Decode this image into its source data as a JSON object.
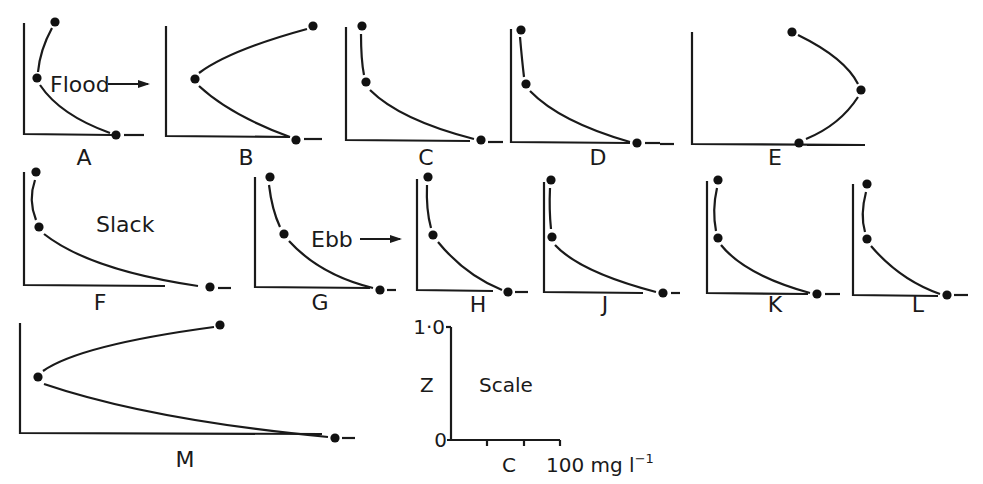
{
  "figure": {
    "ink_color": "#1a1a1a",
    "background": "#ffffff"
  },
  "annotations": {
    "flood": {
      "text": "Flood",
      "x": 50,
      "y": 92,
      "arrow": [
        108,
        84,
        148,
        84
      ]
    },
    "slack": {
      "text": "Slack",
      "x": 96,
      "y": 232
    },
    "ebb": {
      "text": "Ebb",
      "x": 311,
      "y": 247,
      "arrow": [
        360,
        239,
        400,
        239
      ]
    }
  },
  "panels": [
    {
      "id": "A",
      "label": "A",
      "axis": {
        "x0": 24,
        "ytop": 23,
        "ybot": 134,
        "xend": 112
      },
      "points": [
        [
          55,
          22
        ],
        [
          37,
          78
        ],
        [
          116,
          135
        ]
      ],
      "curves": [
        "M 52 28 Q 40 50 38 72",
        "M 40 85 Q 60 115 110 133"
      ],
      "dash": [
        124,
        135,
        144,
        135
      ],
      "labelPos": [
        84,
        165
      ]
    },
    {
      "id": "B",
      "label": "B",
      "axis": {
        "x0": 166,
        "ytop": 26,
        "ybot": 136,
        "xend": 290
      },
      "points": [
        [
          313,
          26
        ],
        [
          195,
          79
        ],
        [
          296,
          140
        ]
      ],
      "curves": [
        "M 307 29 Q 230 50 199 73",
        "M 199 86 Q 230 115 290 137"
      ],
      "dash": [
        304,
        139,
        322,
        139
      ],
      "labelPos": [
        246,
        165
      ]
    },
    {
      "id": "C",
      "label": "C",
      "axis": {
        "x0": 346,
        "ytop": 27,
        "ybot": 140,
        "xend": 470
      },
      "points": [
        [
          362,
          26
        ],
        [
          366,
          82
        ],
        [
          481,
          140
        ]
      ],
      "curves": [
        "M 361 34 Q 361 60 364 75",
        "M 370 90 Q 400 120 474 139"
      ],
      "dash": [
        488,
        142,
        503,
        142
      ],
      "labelPos": [
        426,
        165
      ]
    },
    {
      "id": "D",
      "label": "D",
      "axis": {
        "x0": 511,
        "ytop": 29,
        "ybot": 142,
        "xend": 630
      },
      "points": [
        [
          521,
          30
        ],
        [
          526,
          84
        ],
        [
          637,
          143
        ]
      ],
      "curves": [
        "M 520 37 Q 522 60 524 77",
        "M 530 91 Q 560 122 630 142"
      ],
      "dash": [
        645,
        143,
        660,
        143
      ],
      "labelPos": [
        598,
        165
      ]
    },
    {
      "id": "E",
      "label": "E",
      "axis": {
        "x0": 692,
        "ytop": 32,
        "ybot": 144,
        "xend": 865
      },
      "points": [
        [
          792,
          32
        ],
        [
          861,
          90
        ],
        [
          799,
          143
        ]
      ],
      "curves": [
        "M 798 35 Q 845 58 858 84",
        "M 858 97 Q 840 125 806 139"
      ],
      "dash": [
        807,
        145,
        865,
        145
      ],
      "extraDash": [
        660,
        144,
        674,
        144
      ],
      "labelPos": [
        775,
        165
      ]
    },
    {
      "id": "F",
      "label": "F",
      "axis": {
        "x0": 24,
        "ytop": 172,
        "ybot": 285,
        "xend": 165
      },
      "points": [
        [
          36,
          172
        ],
        [
          39,
          227
        ],
        [
          210,
          287
        ]
      ],
      "curves": [
        "M 35 180 Q 28 200 36 220",
        "M 44 234 Q 90 270 198 286"
      ],
      "dash": [
        218,
        288,
        231,
        288
      ],
      "labelPos": [
        100,
        310
      ]
    },
    {
      "id": "G",
      "label": "G",
      "axis": {
        "x0": 255,
        "ytop": 177,
        "ybot": 287,
        "xend": 370
      },
      "points": [
        [
          270,
          177
        ],
        [
          284,
          234
        ],
        [
          380,
          290
        ]
      ],
      "curves": [
        "M 269 185 Q 272 210 280 227",
        "M 289 241 Q 320 275 373 288"
      ],
      "dash": [
        387,
        290,
        396,
        290
      ],
      "labelPos": [
        320,
        310
      ]
    },
    {
      "id": "H",
      "label": "H",
      "axis": {
        "x0": 417,
        "ytop": 179,
        "ybot": 290,
        "xend": 493
      },
      "points": [
        [
          428,
          177
        ],
        [
          433,
          235
        ],
        [
          508,
          292
        ]
      ],
      "curves": [
        "M 427 185 Q 426 210 431 228",
        "M 438 242 Q 465 275 502 290"
      ],
      "dash": [
        515,
        292,
        528,
        292
      ],
      "labelPos": [
        478,
        312
      ]
    },
    {
      "id": "J",
      "label": "J",
      "axis": {
        "x0": 544,
        "ytop": 182,
        "ybot": 292,
        "xend": 643
      },
      "points": [
        [
          551,
          180
        ],
        [
          552,
          237
        ],
        [
          663,
          293
        ]
      ],
      "curves": [
        "M 550 188 Q 549 210 551 229",
        "M 555 245 Q 580 272 656 292"
      ],
      "dash": [
        671,
        293,
        680,
        293
      ],
      "labelPos": [
        605,
        312
      ]
    },
    {
      "id": "K",
      "label": "K",
      "axis": {
        "x0": 707,
        "ytop": 181,
        "ybot": 293,
        "xend": 808
      },
      "points": [
        [
          718,
          180
        ],
        [
          718,
          238
        ],
        [
          817,
          294
        ]
      ],
      "curves": [
        "M 717 188 Q 712 210 716 231",
        "M 721 245 Q 745 275 810 293"
      ],
      "dash": [
        825,
        294,
        840,
        294
      ],
      "labelPos": [
        775,
        312
      ]
    },
    {
      "id": "L",
      "label": "L",
      "axis": {
        "x0": 853,
        "ytop": 184,
        "ybot": 295,
        "xend": 938
      },
      "points": [
        [
          867,
          184
        ],
        [
          867,
          239
        ],
        [
          947,
          295
        ]
      ],
      "curves": [
        "M 866 192 Q 860 215 865 232",
        "M 871 246 Q 900 280 940 294"
      ],
      "dash": [
        954,
        295,
        968,
        295
      ],
      "labelPos": [
        918,
        312
      ]
    },
    {
      "id": "M",
      "label": "M",
      "axis": {
        "x0": 20,
        "ytop": 323,
        "ybot": 433,
        "xend": 322
      },
      "points": [
        [
          220,
          325
        ],
        [
          38,
          377
        ],
        [
          335,
          438
        ]
      ],
      "curves": [
        "M 214 327 Q 80 345 43 371",
        "M 44 384 Q 150 420 328 437"
      ],
      "dash": [
        342,
        438,
        355,
        438
      ],
      "labelPos": [
        185,
        467
      ]
    }
  ],
  "scale": {
    "title": "Scale",
    "y_axis_label": "Z",
    "x_axis_label": "C",
    "y_tick_top": "1·0",
    "y_tick_bottom": "0",
    "x_max_label": "100 mg l",
    "x_max_unit_exponent": "−1",
    "axis": {
      "x0": 451,
      "ytop": 327,
      "ybot": 440,
      "xend": 560
    },
    "x_ticks": [
      487,
      524,
      560
    ]
  }
}
